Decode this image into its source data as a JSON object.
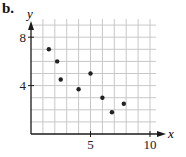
{
  "panel_label": "b.",
  "colors": {
    "axis": "#1a1a1a",
    "grid": "#c8c8c8",
    "point": "#222222",
    "background": "#ffffff"
  },
  "chart_data": {
    "type": "scatter",
    "title": "",
    "xlabel": "x",
    "ylabel": "y",
    "xlim": [
      0,
      10.5
    ],
    "ylim": [
      0,
      9
    ],
    "x_ticks": [
      5,
      10
    ],
    "y_ticks": [
      4,
      8
    ],
    "x_tick_labels": [
      "5",
      "10"
    ],
    "y_tick_labels": [
      "4",
      "8"
    ],
    "grid": true,
    "grid_step": 1,
    "legend": null,
    "points": [
      {
        "x": 1.5,
        "y": 7
      },
      {
        "x": 2.2,
        "y": 6
      },
      {
        "x": 2.5,
        "y": 4.5
      },
      {
        "x": 4,
        "y": 3.7
      },
      {
        "x": 5,
        "y": 5
      },
      {
        "x": 6,
        "y": 3
      },
      {
        "x": 6.8,
        "y": 1.8
      },
      {
        "x": 7.8,
        "y": 2.5
      }
    ]
  }
}
